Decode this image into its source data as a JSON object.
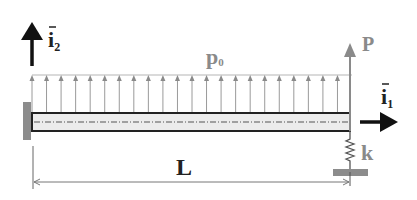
{
  "diagram": {
    "labels": {
      "i2_main": "i",
      "i2_sub": "2",
      "i1_main": "i",
      "i1_sub": "1",
      "load_main": "p",
      "load_sub": "0",
      "force": "P",
      "spring": "k",
      "length": "L"
    },
    "colors": {
      "black": "#111111",
      "gray_arrow": "#8a8a8a",
      "load_arrow": "#9a9a9a",
      "wall": "#8c8c8c",
      "beam_fill": "#ececec",
      "beam_border": "#222222",
      "ground_plate": "#8c8c8c",
      "label_gray": "#7a7a7a"
    },
    "load_arrow_count": 23
  }
}
